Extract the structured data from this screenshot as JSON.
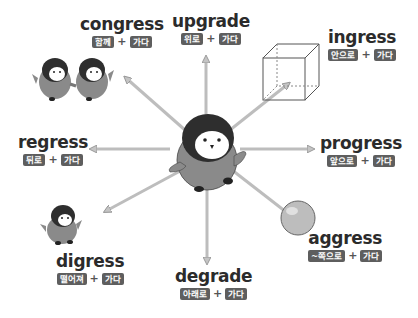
{
  "center": {
    "figure": "penguin-center"
  },
  "terms": [
    {
      "id": "congress",
      "word": "congress",
      "prefix": "함께",
      "root": "가다",
      "figure": "two-penguins-holding-hands"
    },
    {
      "id": "upgrade",
      "word": "upgrade",
      "prefix": "위로",
      "root": "가다"
    },
    {
      "id": "ingress",
      "word": "ingress",
      "prefix": "안으로",
      "root": "가다",
      "figure": "cube"
    },
    {
      "id": "regress",
      "word": "regress",
      "prefix": "뒤로",
      "root": "가다"
    },
    {
      "id": "progress",
      "word": "progress",
      "prefix": "앞으로",
      "root": "가다"
    },
    {
      "id": "digress",
      "word": "digress",
      "prefix": "떨어져",
      "root": "가다",
      "figure": "small-penguin"
    },
    {
      "id": "degrade",
      "word": "degrade",
      "prefix": "아래로",
      "root": "가다"
    },
    {
      "id": "aggress",
      "word": "aggress",
      "prefix": "~쪽으로",
      "root": "가다",
      "figure": "ball"
    }
  ],
  "plus_sign": "+",
  "colors": {
    "arrow": "#b8b8b8",
    "arrow_edge": "#8c8c8c",
    "badge": "#5e5e5e",
    "text": "#2b2b2b",
    "penguin_body": "#8a8a8a",
    "penguin_head": "#2e2e2e"
  }
}
